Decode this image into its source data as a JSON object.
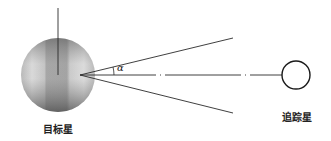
{
  "diagram": {
    "type": "geometry-schematic",
    "target_star": {
      "label": "目标星",
      "shape": "shaded-sphere",
      "center": [
        58,
        75
      ],
      "radius": 37,
      "colors": {
        "light": "#e6e6e6",
        "mid": "#b0b0b0",
        "dark": "#6a6a6a"
      }
    },
    "tracking_star": {
      "label": "追踪星",
      "shape": "outlined-circle",
      "center": [
        296,
        75
      ],
      "radius": 14
    },
    "angle": {
      "symbol": "α",
      "vertex": [
        80,
        75
      ]
    },
    "lines": {
      "vertical_axis": {
        "from": [
          58,
          8
        ],
        "to": [
          58,
          75
        ]
      },
      "upper_ray": {
        "from": [
          80,
          75
        ],
        "to": [
          233,
          38
        ]
      },
      "lower_ray": {
        "from": [
          80,
          75
        ],
        "to": [
          233,
          113
        ]
      },
      "center_line": {
        "from": [
          80,
          75
        ],
        "to": [
          282,
          75
        ],
        "style": "dash-dot"
      }
    },
    "stroke_color": "#2a2a2a"
  }
}
